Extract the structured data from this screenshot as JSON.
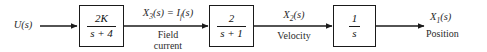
{
  "diagram": {
    "type": "control-system-block-diagram",
    "background_color": "#ffffff",
    "line_color": "#1a1a1a",
    "text_color": "#2b2b2b"
  },
  "input": {
    "label": "U(s)",
    "name": "input-signal"
  },
  "blocks": [
    {
      "id": "block-1",
      "numerator": "2K",
      "denominator": "s + 4",
      "transfer_function": "2K/(s + 4)"
    },
    {
      "id": "block-2",
      "numerator": "2",
      "denominator": "s + 1",
      "transfer_function": "2/(s + 1)"
    },
    {
      "id": "block-3",
      "numerator": "1",
      "denominator": "s",
      "transfer_function": "1/s"
    }
  ],
  "signals": [
    {
      "id": "signal-x3",
      "label_main": "X",
      "label_sub": "3",
      "label_rest": "(s) = I",
      "label_sub2": "f",
      "label_rest2": "(s)",
      "full_label": "X3(s) = If(s)",
      "description_line1": "Field",
      "description_line2": "current"
    },
    {
      "id": "signal-x2",
      "label_main": "X",
      "label_sub": "2",
      "label_rest": "(s)",
      "full_label": "X2(s)",
      "description_line1": "Velocity",
      "description_line2": ""
    },
    {
      "id": "signal-x1",
      "label_main": "X",
      "label_sub": "1",
      "label_rest": "(s)",
      "full_label": "X1(s)",
      "description_line1": "Position",
      "description_line2": ""
    }
  ]
}
